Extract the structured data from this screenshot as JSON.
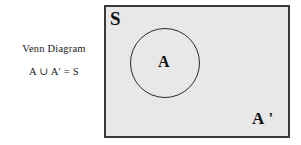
{
  "figure": {
    "caption_title": "Venn Diagram",
    "caption_formula": "A ∪ A' = S",
    "universe_label": "S",
    "set_label": "A",
    "complement_label": "A '",
    "colors": {
      "page_background": "#ffffff",
      "universe_fill": "#e8e8e8",
      "universe_border": "#3a3a3a",
      "circle_border": "#2b2b2b",
      "text": "#111111"
    }
  }
}
